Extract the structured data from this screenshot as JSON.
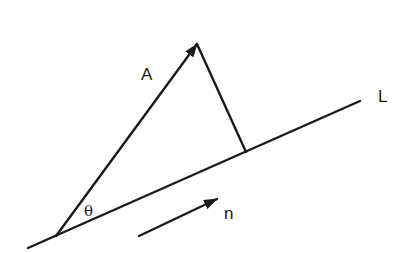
{
  "diagram": {
    "type": "vector-projection",
    "stroke_color": "#1a1a1a",
    "background": "#ffffff",
    "labels": {
      "vector": "A",
      "line": "L",
      "angle": "θ",
      "unit_vector": "n"
    },
    "elements": {
      "line_L": {
        "x1": 28,
        "y1": 248,
        "x2": 360,
        "y2": 101
      },
      "vector_A": {
        "x1": 56,
        "y1": 236,
        "x2": 197,
        "y2": 44
      },
      "perpendicular": {
        "x1": 197,
        "y1": 44,
        "x2": 246,
        "y2": 152
      },
      "unit_vector_n": {
        "x1": 139,
        "y1": 236,
        "x2": 217,
        "y2": 199
      }
    }
  }
}
